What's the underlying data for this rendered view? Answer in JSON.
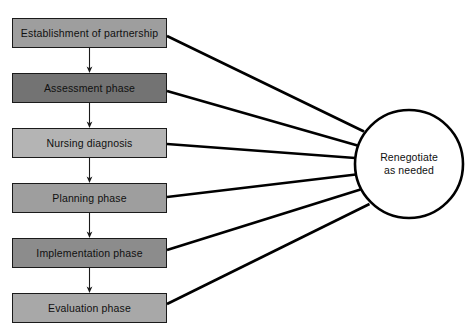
{
  "diagram": {
    "type": "flowchart",
    "canvas": {
      "width": 475,
      "height": 327,
      "background": "#ffffff"
    },
    "style": {
      "box_border_color": "#1a1a1a",
      "connector_color": "#000000",
      "arrow_color": "#1a1a1a",
      "circle_fill": "#ffffff",
      "circle_border_color": "#000000",
      "text_color": "#101010"
    },
    "boxes": [
      {
        "id": "establishment-of-partnership",
        "label": "Establishment of partnership",
        "fill": "#9e9e9e",
        "x": 12,
        "y": 18,
        "width": 155,
        "height": 30
      },
      {
        "id": "assessment-phase",
        "label": "Assessment phase",
        "fill": "#737373",
        "x": 12,
        "y": 73,
        "width": 155,
        "height": 30
      },
      {
        "id": "nursing-diagnosis",
        "label": "Nursing diagnosis",
        "fill": "#b4b4b4",
        "x": 12,
        "y": 128,
        "width": 155,
        "height": 30
      },
      {
        "id": "planning-phase",
        "label": "Planning phase",
        "fill": "#9e9e9e",
        "x": 12,
        "y": 183,
        "width": 155,
        "height": 30
      },
      {
        "id": "implementation-phase",
        "label": "Implementation phase",
        "fill": "#8c8c8c",
        "x": 12,
        "y": 238,
        "width": 155,
        "height": 30
      },
      {
        "id": "evaluation-phase",
        "label": "Evaluation phase",
        "fill": "#a8a8a8",
        "x": 12,
        "y": 293,
        "width": 155,
        "height": 30
      }
    ],
    "circle": {
      "id": "renegotiate-as-needed",
      "label_line_1": "Renegotiate",
      "label_line_2": "as needed",
      "cx": 409,
      "cy": 164,
      "r": 54
    },
    "flow_arrows": [
      {
        "from": "establishment-of-partnership",
        "to": "assessment-phase"
      },
      {
        "from": "assessment-phase",
        "to": "nursing-diagnosis"
      },
      {
        "from": "nursing-diagnosis",
        "to": "planning-phase"
      },
      {
        "from": "planning-phase",
        "to": "implementation-phase"
      },
      {
        "from": "implementation-phase",
        "to": "evaluation-phase"
      }
    ],
    "connectors": [
      {
        "from": "establishment-of-partnership",
        "to": "renegotiate-as-needed"
      },
      {
        "from": "assessment-phase",
        "to": "renegotiate-as-needed"
      },
      {
        "from": "nursing-diagnosis",
        "to": "renegotiate-as-needed"
      },
      {
        "from": "planning-phase",
        "to": "renegotiate-as-needed"
      },
      {
        "from": "implementation-phase",
        "to": "renegotiate-as-needed"
      },
      {
        "from": "evaluation-phase",
        "to": "renegotiate-as-needed"
      }
    ]
  }
}
